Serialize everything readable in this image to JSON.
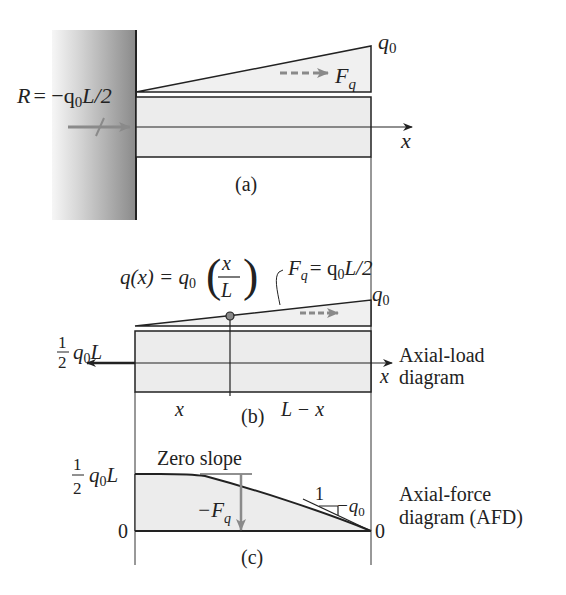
{
  "figure": {
    "panel_a": {
      "caption": "(a)",
      "reaction_label": "R = −q₀L/2",
      "reaction_R": "R",
      "reaction_eq": "= −q",
      "reaction_sub": "0",
      "reaction_tail": "L/2",
      "load_max_label": "q",
      "load_max_sub": "0",
      "resultant_label": "F",
      "resultant_sub": "q",
      "axis_label": "x"
    },
    "panel_b": {
      "caption": "(b)",
      "distributed_load_formula": "q(x) = q₀(x/L)",
      "formula_lhs": "q(x) = q",
      "formula_sub": "0",
      "formula_num": "x",
      "formula_den": "L",
      "resultant_formula": "F_q = q₀L/2",
      "resultant_F": "F",
      "resultant_q": "q",
      "resultant_rhs": "= q",
      "resultant_sub": "0",
      "resultant_tail": "L/2",
      "load_max_label": "q",
      "load_max_sub": "0",
      "end_force_num": "1",
      "end_force_den": "2",
      "end_force_q": "q",
      "end_force_sub": "0",
      "end_force_L": "L",
      "axis_label": "x",
      "segment_left": "x",
      "segment_right": "L − x",
      "side_label_line1": "Axial-load",
      "side_label_line2": "diagram"
    },
    "panel_c": {
      "caption": "(c)",
      "top_value_num": "1",
      "top_value_den": "2",
      "top_value_q": "q",
      "top_value_sub": "0",
      "top_value_L": "L",
      "zero_left": "0",
      "zero_right": "0",
      "zero_slope_label": "Zero slope",
      "drop_label_F": "−F",
      "drop_label_sub": "q",
      "slope_run": "1",
      "slope_value": "−q",
      "slope_value_sub": "0",
      "side_label_line1": "Axial-force",
      "side_label_line2": "diagram (AFD)"
    }
  },
  "colors": {
    "bar_fill": "#ececec",
    "load_fill": "#f0f0f0",
    "line": "#222222",
    "arrow_gray": "#8a8a8a",
    "wall_dark": "#8c8c8c",
    "wall_light": "#f4f4f4"
  }
}
